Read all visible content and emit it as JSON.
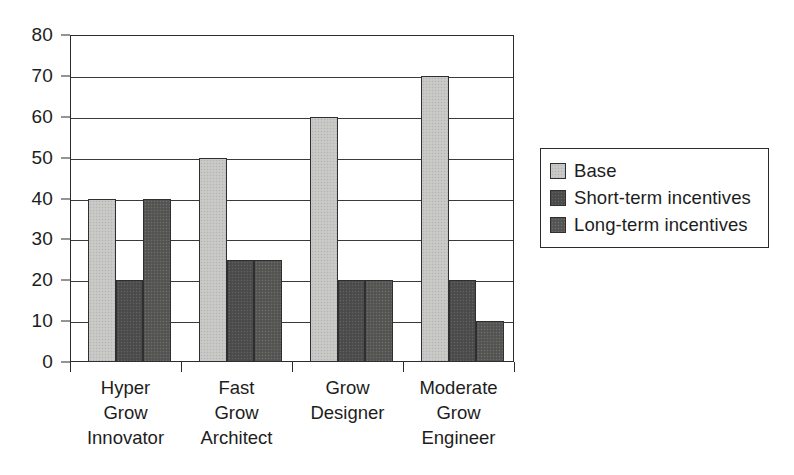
{
  "chart_data": {
    "type": "bar",
    "title": "",
    "subtitle": "",
    "xlabel": "",
    "ylabel": "",
    "ylim": [
      0,
      80
    ],
    "ytick_step": 10,
    "yticks": [
      0,
      10,
      20,
      30,
      40,
      50,
      60,
      70,
      80
    ],
    "ytick_labels": [
      "0",
      "10",
      "20",
      "30",
      "40",
      "50",
      "60",
      "70",
      "80"
    ],
    "grid": true,
    "grid_axis": "y",
    "legend_position": "right",
    "orientation": "vertical",
    "grouping": "grouped",
    "categories": [
      "Hyper\nGrow\nInnovator",
      "Fast\nGrow\nArchitect",
      "Grow\nDesigner",
      "Moderate\nGrow\nEngineer"
    ],
    "series": [
      {
        "name": "Base",
        "color": "#c6c6c4",
        "values": [
          40,
          50,
          60,
          70
        ]
      },
      {
        "name": "Short-term incentives",
        "color": "#4e4e4e",
        "values": [
          20,
          25,
          20,
          20
        ]
      },
      {
        "name": "Long-term incentives",
        "color": "#585856",
        "values": [
          40,
          25,
          20,
          10
        ]
      }
    ],
    "annotations": []
  },
  "legend": {
    "entries": [
      {
        "label": "Base",
        "swatch": "legend-swatch-base"
      },
      {
        "label": "Short-term incentives",
        "swatch": "legend-swatch-short-term"
      },
      {
        "label": "Long-term incentives",
        "swatch": "legend-swatch-long-term"
      }
    ]
  },
  "colors": {
    "axis": "#2b2b2b",
    "gridline": "#3a3a3a",
    "text": "#1d1d1d",
    "background": "#ffffff",
    "series_base": "#c6c6c4",
    "series_short_term": "#4e4e4e",
    "series_long_term": "#585856"
  }
}
